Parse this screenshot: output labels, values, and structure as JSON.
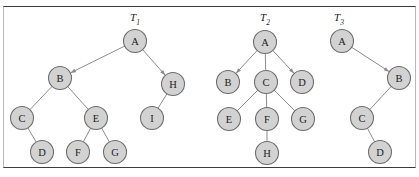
{
  "figure": {
    "background_color": "#ffffff",
    "frame_color": "#3a3a3a",
    "node_fill": "#d2d2d2",
    "node_stroke": "#6e6e6e",
    "edge_color": "#8c8c8c",
    "label_color": "#1c1c1c"
  },
  "trees": [
    {
      "id": "T1",
      "title": "T",
      "subscript": "1",
      "title_x": 135,
      "title_y": 19,
      "nodes": [
        {
          "label": "A",
          "x": 135,
          "y": 41
        },
        {
          "label": "B",
          "x": 60,
          "y": 78
        },
        {
          "label": "H",
          "x": 173,
          "y": 84
        },
        {
          "label": "C",
          "x": 22,
          "y": 118
        },
        {
          "label": "E",
          "x": 96,
          "y": 118
        },
        {
          "label": "I",
          "x": 152,
          "y": 118
        },
        {
          "label": "D",
          "x": 42,
          "y": 152
        },
        {
          "label": "F",
          "x": 78,
          "y": 152
        },
        {
          "label": "G",
          "x": 115,
          "y": 152
        }
      ],
      "edges": [
        {
          "from": "A",
          "to": "B",
          "arrow": true
        },
        {
          "from": "A",
          "to": "H",
          "arrow": true
        },
        {
          "from": "B",
          "to": "C",
          "arrow": false
        },
        {
          "from": "B",
          "to": "E",
          "arrow": false
        },
        {
          "from": "H",
          "to": "I",
          "arrow": false
        },
        {
          "from": "C",
          "to": "D",
          "arrow": false
        },
        {
          "from": "E",
          "to": "F",
          "arrow": false
        },
        {
          "from": "E",
          "to": "G",
          "arrow": false
        }
      ]
    },
    {
      "id": "T2",
      "title": "T",
      "subscript": "2",
      "title_x": 265,
      "title_y": 19,
      "nodes": [
        {
          "label": "A",
          "x": 265,
          "y": 42
        },
        {
          "label": "B",
          "x": 228,
          "y": 82
        },
        {
          "label": "C",
          "x": 266,
          "y": 82
        },
        {
          "label": "D",
          "x": 302,
          "y": 82
        },
        {
          "label": "E",
          "x": 229,
          "y": 119
        },
        {
          "label": "F",
          "x": 267,
          "y": 119
        },
        {
          "label": "G",
          "x": 303,
          "y": 119
        },
        {
          "label": "H",
          "x": 267,
          "y": 153
        }
      ],
      "edges": [
        {
          "from": "A",
          "to": "B",
          "arrow": true
        },
        {
          "from": "A",
          "to": "C",
          "arrow": false
        },
        {
          "from": "A",
          "to": "D",
          "arrow": true
        },
        {
          "from": "C",
          "to": "E",
          "arrow": false
        },
        {
          "from": "C",
          "to": "F",
          "arrow": false
        },
        {
          "from": "C",
          "to": "G",
          "arrow": false
        },
        {
          "from": "F",
          "to": "H",
          "arrow": false
        }
      ]
    },
    {
      "id": "T3",
      "title": "T",
      "subscript": "3",
      "title_x": 339,
      "title_y": 19,
      "nodes": [
        {
          "label": "A",
          "x": 342,
          "y": 41
        },
        {
          "label": "B",
          "x": 399,
          "y": 78
        },
        {
          "label": "C",
          "x": 362,
          "y": 118
        },
        {
          "label": "D",
          "x": 380,
          "y": 152
        }
      ],
      "edges": [
        {
          "from": "A",
          "to": "B",
          "arrow": true
        },
        {
          "from": "B",
          "to": "C",
          "arrow": false
        },
        {
          "from": "C",
          "to": "D",
          "arrow": false
        }
      ]
    }
  ],
  "node_radius": 11.5
}
